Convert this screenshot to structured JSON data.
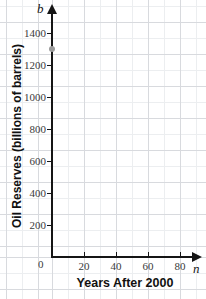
{
  "chart_data": {
    "type": "scatter",
    "title": "",
    "xlabel": "Years After 2000",
    "ylabel": "Oil Reserves (billions of barrels)",
    "x_variable": "n",
    "y_variable": "b",
    "grid": true,
    "legend": "none",
    "xlim": [
      0,
      90
    ],
    "ylim": [
      0,
      1500
    ],
    "x_ticks": [
      0,
      20,
      40,
      60,
      80
    ],
    "x_tick_labels": [
      "0",
      "20",
      "40",
      "60",
      "80"
    ],
    "y_ticks": [
      200,
      400,
      600,
      800,
      1000,
      1200,
      1400
    ],
    "y_tick_labels": [
      "200",
      "400",
      "600",
      "800",
      "1000",
      "1200",
      "1400"
    ],
    "x_tick_step_minor": 10,
    "y_tick_step_minor": 100,
    "points": [
      {
        "x": 0,
        "y": 1300
      }
    ]
  },
  "axes": {
    "y_axis_variable": "b",
    "x_axis_variable": "n",
    "x_axis_title": "Years After 2000",
    "y_axis_title": "Oil Reserves (billions of barrels)",
    "origin_label": "0"
  },
  "colors": {
    "axis": "#151515",
    "grid_minor": "#eceef0",
    "grid_major": "#d8dade",
    "tick_label": "#3a3a3a",
    "point": "#9a9a9a",
    "background": "#ffffff"
  }
}
